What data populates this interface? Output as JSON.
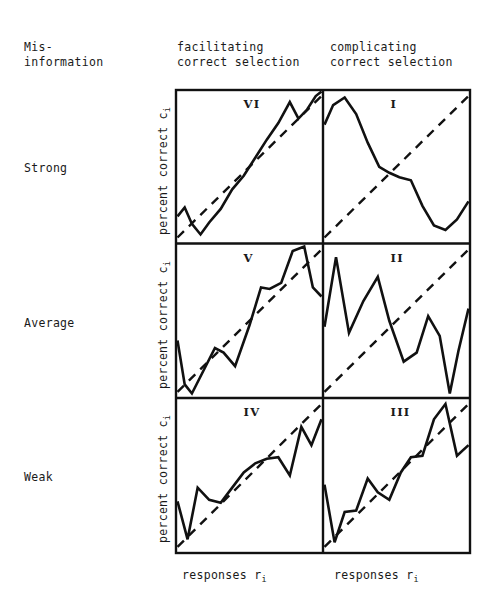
{
  "figure": {
    "row_header_title": "Mis-\ninformation",
    "columns": [
      {
        "id": "facilitating",
        "header": "facilitating\ncorrect selection",
        "xlabel_main": "responses r",
        "xlabel_sub": "i"
      },
      {
        "id": "complicating",
        "header": "complicating\ncorrect selection",
        "xlabel_main": "responses r",
        "xlabel_sub": "i"
      }
    ],
    "rows": [
      {
        "id": "strong",
        "label": "Strong"
      },
      {
        "id": "average",
        "label": "Average"
      },
      {
        "id": "weak",
        "label": "Weak"
      }
    ],
    "ylabel_main": "percent correct c",
    "ylabel_sub": "i",
    "line_color": "#111111",
    "background_color": "#ffffff"
  },
  "chart_data": {
    "type": "line",
    "title": "",
    "xlabel": "responses r_i",
    "ylabel": "percent correct c_i",
    "xlim": [
      0,
      1
    ],
    "ylim": [
      0,
      1
    ],
    "grid": false,
    "legend": null,
    "layout": {
      "rows": 3,
      "cols": 2,
      "row_labels": [
        "Strong",
        "Average",
        "Weak"
      ],
      "col_labels": [
        "facilitating correct selection",
        "complicating correct selection"
      ]
    },
    "panels": [
      {
        "tag": "VI",
        "row": "Strong",
        "col": "facilitating",
        "reference_line": {
          "name": "identity",
          "style": "dashed",
          "x": [
            0.0,
            1.0
          ],
          "y": [
            0.03,
            0.97
          ]
        },
        "series": [
          {
            "name": "observed",
            "style": "solid",
            "x": [
              0.0,
              0.05,
              0.1,
              0.16,
              0.22,
              0.3,
              0.38,
              0.46,
              0.54,
              0.62,
              0.7,
              0.78,
              0.84,
              0.9,
              0.96,
              1.0
            ],
            "y": [
              0.17,
              0.23,
              0.12,
              0.05,
              0.13,
              0.22,
              0.35,
              0.44,
              0.56,
              0.68,
              0.79,
              0.93,
              0.82,
              0.88,
              0.97,
              1.0
            ]
          }
        ]
      },
      {
        "tag": "I",
        "row": "Strong",
        "col": "complicating",
        "reference_line": {
          "name": "identity",
          "style": "dashed",
          "x": [
            0.0,
            1.0
          ],
          "y": [
            0.03,
            0.97
          ]
        },
        "series": [
          {
            "name": "observed",
            "style": "solid",
            "x": [
              0.0,
              0.06,
              0.14,
              0.22,
              0.3,
              0.38,
              0.45,
              0.52,
              0.6,
              0.68,
              0.76,
              0.84,
              0.92,
              1.0
            ],
            "y": [
              0.78,
              0.91,
              0.96,
              0.85,
              0.66,
              0.5,
              0.46,
              0.43,
              0.41,
              0.24,
              0.11,
              0.08,
              0.15,
              0.27
            ]
          }
        ]
      },
      {
        "tag": "V",
        "row": "Average",
        "col": "facilitating",
        "reference_line": {
          "name": "identity",
          "style": "dashed",
          "x": [
            0.0,
            1.0
          ],
          "y": [
            0.03,
            0.97
          ]
        },
        "series": [
          {
            "name": "observed",
            "style": "solid",
            "x": [
              0.0,
              0.05,
              0.1,
              0.18,
              0.26,
              0.32,
              0.4,
              0.5,
              0.58,
              0.64,
              0.72,
              0.8,
              0.88,
              0.94,
              1.0
            ],
            "y": [
              0.37,
              0.08,
              0.02,
              0.17,
              0.32,
              0.29,
              0.2,
              0.47,
              0.72,
              0.71,
              0.75,
              0.96,
              0.99,
              0.72,
              0.66
            ]
          }
        ]
      },
      {
        "tag": "II",
        "row": "Average",
        "col": "complicating",
        "reference_line": {
          "name": "identity",
          "style": "dashed",
          "x": [
            0.0,
            1.0
          ],
          "y": [
            0.03,
            0.97
          ]
        },
        "series": [
          {
            "name": "observed",
            "style": "solid",
            "x": [
              0.0,
              0.08,
              0.17,
              0.27,
              0.37,
              0.45,
              0.55,
              0.64,
              0.72,
              0.8,
              0.87,
              0.93,
              1.0
            ],
            "y": [
              0.46,
              0.92,
              0.42,
              0.63,
              0.79,
              0.5,
              0.23,
              0.29,
              0.53,
              0.4,
              0.02,
              0.3,
              0.58
            ]
          }
        ]
      },
      {
        "tag": "IV",
        "row": "Weak",
        "col": "facilitating",
        "reference_line": {
          "name": "identity",
          "style": "dashed",
          "x": [
            0.0,
            1.0
          ],
          "y": [
            0.03,
            0.97
          ]
        },
        "series": [
          {
            "name": "observed",
            "style": "solid",
            "x": [
              0.0,
              0.07,
              0.14,
              0.22,
              0.3,
              0.38,
              0.46,
              0.54,
              0.62,
              0.7,
              0.78,
              0.86,
              0.93,
              1.0
            ],
            "y": [
              0.33,
              0.08,
              0.42,
              0.34,
              0.32,
              0.42,
              0.52,
              0.58,
              0.61,
              0.62,
              0.5,
              0.82,
              0.7,
              0.87
            ]
          }
        ]
      },
      {
        "tag": "III",
        "row": "Weak",
        "col": "complicating",
        "reference_line": {
          "name": "identity",
          "style": "dashed",
          "x": [
            0.0,
            1.0
          ],
          "y": [
            0.03,
            0.97
          ]
        },
        "series": [
          {
            "name": "observed",
            "style": "solid",
            "x": [
              0.0,
              0.07,
              0.14,
              0.22,
              0.3,
              0.37,
              0.45,
              0.53,
              0.6,
              0.68,
              0.76,
              0.84,
              0.92,
              1.0
            ],
            "y": [
              0.44,
              0.06,
              0.26,
              0.27,
              0.48,
              0.39,
              0.34,
              0.52,
              0.62,
              0.63,
              0.87,
              0.97,
              0.63,
              0.7
            ]
          }
        ]
      }
    ]
  }
}
